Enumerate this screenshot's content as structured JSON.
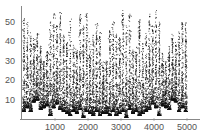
{
  "chart_data": {
    "type": "scatter",
    "title": "",
    "xlabel": "",
    "ylabel": "",
    "xlim": [
      0,
      5000
    ],
    "ylim": [
      0,
      56
    ],
    "grid": false,
    "legend": null,
    "x_ticks": [
      1000,
      2000,
      3000,
      4000,
      5000
    ],
    "y_ticks": [
      10,
      20,
      30,
      40,
      50
    ],
    "x_tick_labels": [
      "1000",
      "2000",
      "3000",
      "4000",
      "5000"
    ],
    "y_tick_labels": [
      "10",
      "20",
      "30",
      "40",
      "50"
    ],
    "point_color": "#111111",
    "series": [
      {
        "name": "sequence",
        "description": "Dense point cloud: each spike spans from a low baseline up to a sparse top; pattern is roughly symmetric about x=2500",
        "spikes": [
          {
            "x": 50,
            "low": 4,
            "high": 52
          },
          {
            "x": 150,
            "low": 6,
            "high": 50
          },
          {
            "x": 250,
            "low": 4,
            "high": 45
          },
          {
            "x": 350,
            "low": 9,
            "high": 42
          },
          {
            "x": 450,
            "low": 10,
            "high": 44
          },
          {
            "x": 550,
            "low": 5,
            "high": 38
          },
          {
            "x": 650,
            "low": 6,
            "high": 30
          },
          {
            "x": 750,
            "low": 7,
            "high": 35
          },
          {
            "x": 850,
            "low": 2,
            "high": 50
          },
          {
            "x": 950,
            "low": 6,
            "high": 56
          },
          {
            "x": 1050,
            "low": 8,
            "high": 48
          },
          {
            "x": 1150,
            "low": 5,
            "high": 55
          },
          {
            "x": 1250,
            "low": 4,
            "high": 44
          },
          {
            "x": 1350,
            "low": 3,
            "high": 40
          },
          {
            "x": 1450,
            "low": 2,
            "high": 52
          },
          {
            "x": 1550,
            "low": 4,
            "high": 38
          },
          {
            "x": 1650,
            "low": 3,
            "high": 36
          },
          {
            "x": 1750,
            "low": 5,
            "high": 54
          },
          {
            "x": 1850,
            "low": 1,
            "high": 48
          },
          {
            "x": 1950,
            "low": 4,
            "high": 56
          },
          {
            "x": 2050,
            "low": 3,
            "high": 42
          },
          {
            "x": 2150,
            "low": 2,
            "high": 44
          },
          {
            "x": 2250,
            "low": 4,
            "high": 50
          },
          {
            "x": 2350,
            "low": 2,
            "high": 46
          },
          {
            "x": 2450,
            "low": 3,
            "high": 30
          },
          {
            "x": 2550,
            "low": 3,
            "high": 30
          },
          {
            "x": 2650,
            "low": 2,
            "high": 46
          },
          {
            "x": 2750,
            "low": 4,
            "high": 50
          },
          {
            "x": 2850,
            "low": 2,
            "high": 44
          },
          {
            "x": 2950,
            "low": 3,
            "high": 42
          },
          {
            "x": 3050,
            "low": 4,
            "high": 56
          },
          {
            "x": 3150,
            "low": 1,
            "high": 48
          },
          {
            "x": 3250,
            "low": 5,
            "high": 54
          },
          {
            "x": 3350,
            "low": 3,
            "high": 36
          },
          {
            "x": 3450,
            "low": 4,
            "high": 38
          },
          {
            "x": 3550,
            "low": 2,
            "high": 52
          },
          {
            "x": 3650,
            "low": 3,
            "high": 40
          },
          {
            "x": 3750,
            "low": 4,
            "high": 44
          },
          {
            "x": 3850,
            "low": 5,
            "high": 55
          },
          {
            "x": 3950,
            "low": 8,
            "high": 48
          },
          {
            "x": 4050,
            "low": 6,
            "high": 56
          },
          {
            "x": 4150,
            "low": 2,
            "high": 50
          },
          {
            "x": 4250,
            "low": 7,
            "high": 35
          },
          {
            "x": 4350,
            "low": 6,
            "high": 30
          },
          {
            "x": 4450,
            "low": 5,
            "high": 38
          },
          {
            "x": 4550,
            "low": 10,
            "high": 44
          },
          {
            "x": 4650,
            "low": 9,
            "high": 42
          },
          {
            "x": 4750,
            "low": 4,
            "high": 45
          },
          {
            "x": 4850,
            "low": 6,
            "high": 50
          },
          {
            "x": 4950,
            "low": 4,
            "high": 52
          }
        ]
      }
    ]
  }
}
